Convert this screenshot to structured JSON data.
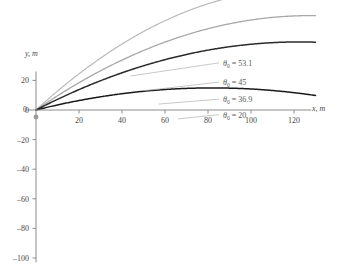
{
  "chart_data": {
    "type": "line",
    "title": "",
    "xlabel": "x, m",
    "ylabel": "y, m",
    "xlim": [
      -4,
      132
    ],
    "ylim": [
      -104,
      30
    ],
    "grid": false,
    "legend_position": "inline-annotations",
    "xticks": [
      0,
      20,
      40,
      60,
      80,
      100,
      120
    ],
    "yticks": [
      20,
      0,
      -20,
      -40,
      -60,
      -80,
      -100
    ],
    "xtick_labels": [
      "0",
      "20",
      "40",
      "60",
      "80",
      "100",
      "120"
    ],
    "ytick_labels": [
      "20",
      "0",
      "-20",
      "-40",
      "-60",
      "-80",
      "-100"
    ],
    "physics": {
      "v0": 50,
      "g": 9.8,
      "launch_point": [
        0,
        0
      ]
    },
    "series": [
      {
        "name": "theta0-53-1",
        "label_prefix": "θ",
        "label_sub": "0",
        "label_value": "= 53.1",
        "label_full": "θ₀ = 53.1",
        "angle_deg": 53.1,
        "color": "#b9b9b9",
        "width": 1.2,
        "range_m": 58.5,
        "peak": [
          29.2,
          26.0
        ],
        "label_xy": [
          87.0,
          30.5
        ],
        "leader_from": [
          44.0,
          23.0
        ],
        "x": [
          0,
          5,
          10,
          15,
          20,
          25,
          30,
          35,
          40,
          45,
          50,
          55,
          58.5,
          65,
          70,
          75,
          80,
          85,
          90,
          95,
          100
        ],
        "y": [
          0,
          6.05,
          11.3,
          15.75,
          19.4,
          22.25,
          24.3,
          25.55,
          26.0,
          25.65,
          24.5,
          22.55,
          20.7,
          15.75,
          11.3,
          6.05,
          0,
          -6.85,
          -14.5,
          -22.95,
          -32.2
        ]
      },
      {
        "name": "theta0-45",
        "label_prefix": "θ",
        "label_sub": "0",
        "label_value": "= 45",
        "label_full": "θ₀ = 45",
        "angle_deg": 45,
        "color": "#a8a8a8",
        "width": 1.3,
        "range_m": 63.8,
        "peak": [
          31.9,
          15.9
        ],
        "label_xy": [
          87.0,
          17.5
        ],
        "leader_from": [
          50.0,
          13.0
        ],
        "x": [
          0,
          5,
          10,
          15,
          20,
          25,
          30,
          35,
          40,
          45,
          50,
          55,
          60,
          63.8,
          70,
          75,
          80,
          85,
          90,
          95,
          100
        ],
        "y": [
          0,
          4.5,
          8.4,
          11.7,
          14.4,
          16.4,
          17.8,
          18.6,
          18.7,
          18.2,
          17.0,
          15.2,
          12.7,
          10.5,
          5.4,
          0.8,
          -4.5,
          -10.4,
          -17.0,
          -24.2,
          -32.0
        ]
      },
      {
        "name": "theta0-36-9",
        "label_prefix": "θ",
        "label_sub": "0",
        "label_value": "= 36.9",
        "label_full": "θ₀ = 36.9",
        "angle_deg": 36.9,
        "color": "#2b2b2b",
        "width": 1.5,
        "range_m": 58.5,
        "peak": [
          29.2,
          14.6
        ],
        "label_xy": [
          87.0,
          6.0
        ],
        "leader_from": [
          57.0,
          4.0
        ],
        "x": [
          0,
          5,
          10,
          15,
          20,
          25,
          30,
          35,
          40,
          45,
          50,
          55,
          58.5,
          65,
          70,
          75,
          80,
          85,
          90,
          95,
          100
        ],
        "y": [
          0,
          3.4,
          6.35,
          8.85,
          10.9,
          12.5,
          13.65,
          14.35,
          14.6,
          14.4,
          13.75,
          12.65,
          11.6,
          8.85,
          6.35,
          3.4,
          0,
          -3.85,
          -8.15,
          -12.9,
          -18.1
        ]
      },
      {
        "name": "theta0-20",
        "label_prefix": "θ",
        "label_sub": "0",
        "label_value": "= 20",
        "label_full": "θ₀ = 20",
        "angle_deg": 20,
        "color": "#1a1a1a",
        "width": 1.5,
        "range_m": 40.9,
        "peak": [
          20.5,
          7.5
        ],
        "label_xy": [
          87.0,
          -4.5
        ],
        "leader_from": [
          66.0,
          -6.0
        ],
        "x": [
          0,
          5,
          10,
          15,
          20,
          25,
          30,
          35,
          40,
          40.9,
          50,
          55,
          60,
          65,
          70,
          75,
          80,
          85,
          90,
          95,
          100
        ],
        "y": [
          0,
          1.55,
          2.9,
          4.0,
          4.85,
          5.45,
          5.8,
          5.9,
          5.75,
          5.7,
          2.6,
          0.4,
          -2.3,
          -5.4,
          -9.0,
          -13.0,
          -17.5,
          -22.4,
          -27.8,
          -33.6,
          -39.9
        ]
      }
    ],
    "annotations": [
      {
        "text": "θ₀ = 53.1"
      },
      {
        "text": "θ₀ = 45"
      },
      {
        "text": "θ₀ = 36.9"
      },
      {
        "text": "θ₀ = 20"
      }
    ],
    "colors": {
      "axis": "#8c8c8c",
      "text": "#4a4a4a",
      "leader": "#b0b0b0",
      "background": "#ffffff"
    }
  }
}
